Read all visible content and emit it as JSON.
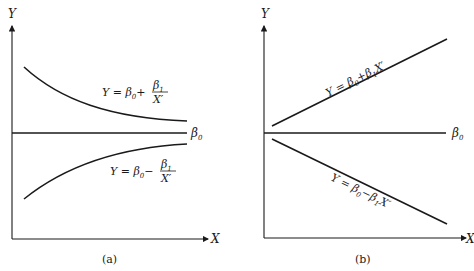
{
  "panels": [
    {
      "id": "a",
      "caption": "(a)",
      "y_axis_label": "Y",
      "x_axis_label": "X",
      "asymptote_label": "β",
      "asymptote_sub": "0",
      "upper_curve": {
        "lhs": "Y = β",
        "sub0": "0",
        "op": "+",
        "num": "β",
        "num_sub": "1",
        "den": "X′"
      },
      "lower_curve": {
        "lhs": "Y = β",
        "sub0": "0",
        "op": "−",
        "num": "β",
        "num_sub": "1",
        "den": "X′"
      }
    },
    {
      "id": "b",
      "caption": "(b)",
      "y_axis_label": "Y",
      "x_axis_label": "X",
      "baseline_label": "β",
      "baseline_sub": "0",
      "upper_line": {
        "text_a": "Y = β",
        "sub0": "0",
        "text_b": "+β",
        "sub1": "1",
        "text_c": "X′"
      },
      "lower_line": {
        "text_a": "Y = β",
        "sub0": "0",
        "text_b": "−β",
        "sub1": "1",
        "text_c": "X′"
      }
    }
  ]
}
